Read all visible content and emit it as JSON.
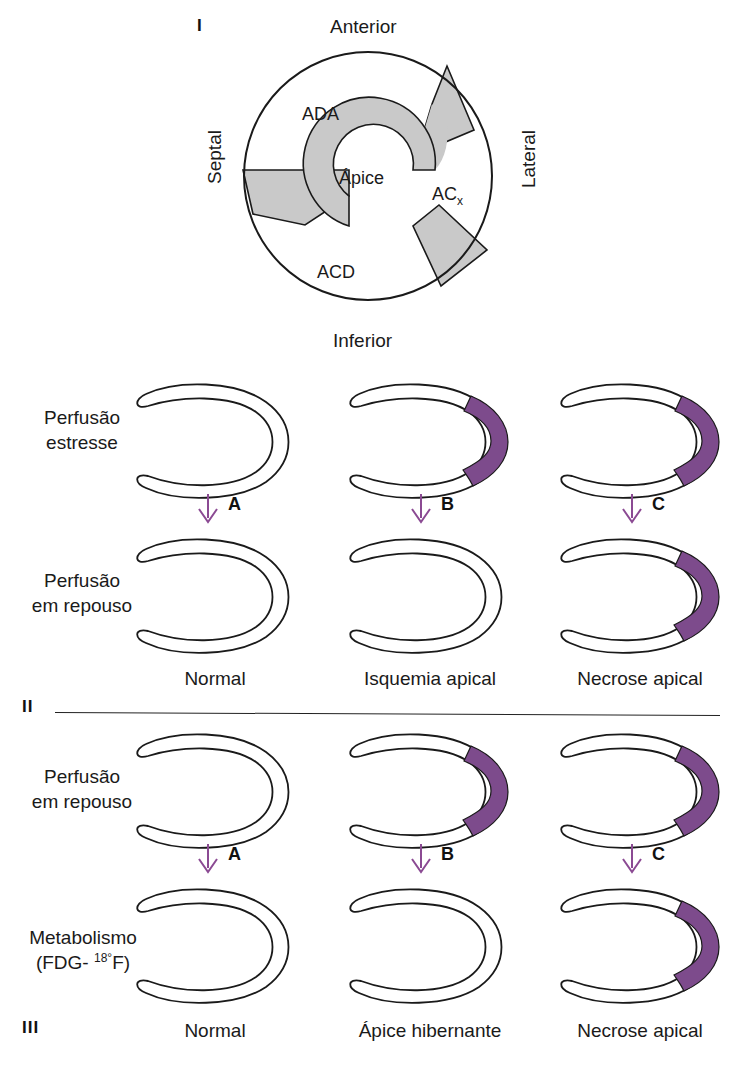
{
  "figure": {
    "panels": [
      {
        "numeral": "I"
      },
      {
        "numeral": "II"
      },
      {
        "numeral": "III"
      }
    ]
  },
  "colors": {
    "defect_purple": "#7d4b8c",
    "arrow_purple": "#8b4a93",
    "gray_fill": "#c8c8c8",
    "outline": "#1a1a1a"
  },
  "panel_one": {
    "numeral": "I",
    "directions": {
      "top": "Anterior",
      "bottom": "Inferior",
      "left": "Septal",
      "right": "Lateral"
    },
    "territories": [
      {
        "id": "ada",
        "label": "ADA"
      },
      {
        "id": "apice",
        "label": "Ápice"
      },
      {
        "id": "acx",
        "label": "AC",
        "subscript": "x"
      },
      {
        "id": "acd",
        "label": "ACD"
      }
    ]
  },
  "panel_two": {
    "numeral": "II",
    "row_labels": {
      "top": "Perfusão\nestresse",
      "top_line1": "Perfusão",
      "top_line2": "estresse",
      "bottom_line1": "Perfusão",
      "bottom_line2": "em repouso"
    },
    "columns": [
      {
        "caption": "Normal",
        "arrow_letter": "A",
        "top_defect": false,
        "bottom_defect": false
      },
      {
        "caption": "Isquemia apical",
        "arrow_letter": "B",
        "top_defect": true,
        "bottom_defect": false
      },
      {
        "caption": "Necrose apical",
        "arrow_letter": "C",
        "top_defect": true,
        "bottom_defect": true
      }
    ]
  },
  "panel_three": {
    "numeral": "III",
    "row_labels": {
      "top_line1": "Perfusão",
      "top_line2": "em repouso",
      "bottom_line1": "Metabolismo",
      "bottom_line2_pre": "(FDG- ",
      "bottom_line2_sup": "18°",
      "bottom_line2_post": "F)"
    },
    "columns": [
      {
        "caption": "Normal",
        "arrow_letter": "A",
        "top_defect": false,
        "bottom_defect": false
      },
      {
        "caption": "Ápice hibernante",
        "arrow_letter": "B",
        "top_defect": true,
        "bottom_defect": false
      },
      {
        "caption": "Necrose apical",
        "arrow_letter": "C",
        "top_defect": true,
        "bottom_defect": true
      }
    ]
  }
}
